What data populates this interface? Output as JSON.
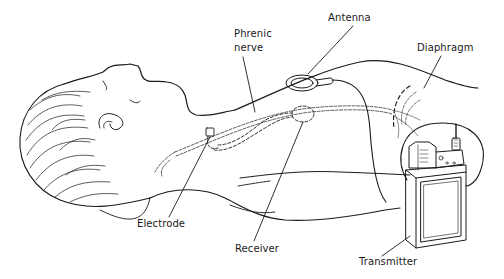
{
  "diagram": {
    "type": "medical-illustration",
    "labels": {
      "antenna": "Antenna",
      "phrenic_line1": "Phrenic",
      "phrenic_line2": "nerve",
      "diaphragm": "Diaphragm",
      "electrode": "Electrode",
      "receiver": "Receiver",
      "transmitter": "Transmitter"
    },
    "colors": {
      "line": "#1a1a1a",
      "background": "#ffffff"
    }
  }
}
